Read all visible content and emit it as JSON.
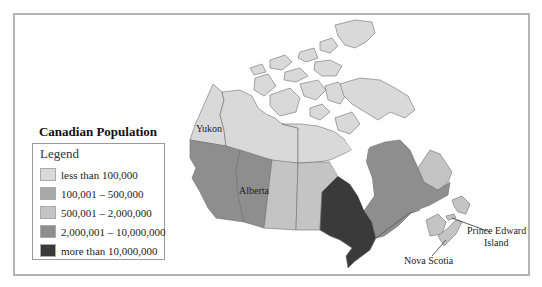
{
  "title": "Canadian Population",
  "legend": {
    "heading": "Legend",
    "items": [
      {
        "label": "less than 100,000",
        "color": "#d9d9d9"
      },
      {
        "label": "100,001 – 500,000",
        "color": "#a8a8a8"
      },
      {
        "label": "500,001 – 2,000,000",
        "color": "#c4c4c4"
      },
      {
        "label": "2,000,001 – 10,000,000",
        "color": "#8e8e8e"
      },
      {
        "label": "more than 10,000,000",
        "color": "#3a3a3a"
      }
    ]
  },
  "labels": {
    "yukon": "Yukon",
    "alberta": "Alberta",
    "pei_line1": "Prince Edward",
    "pei_line2": "Island",
    "nova_scotia": "Nova Scotia"
  }
}
